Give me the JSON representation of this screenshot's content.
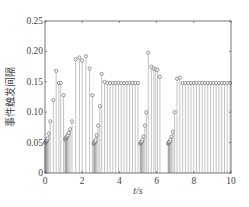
{
  "chart_data": {
    "type": "stem",
    "title": "",
    "xlabel": "t/s",
    "ylabel": "事件触发间隔",
    "xlim": [
      0,
      10
    ],
    "ylim": [
      0,
      0.25
    ],
    "xticks": [
      0,
      2,
      4,
      6,
      8,
      10
    ],
    "xtick_labels": [
      "0",
      "2",
      "4",
      "6",
      "8",
      "10"
    ],
    "yticks": [
      0,
      0.05,
      0.1,
      0.15,
      0.2,
      0.25
    ],
    "ytick_labels": [
      "0",
      "0.05",
      "0.10",
      "0.15",
      "0.20",
      "0.25"
    ],
    "grid": false,
    "legend": null,
    "marker": "circle",
    "series": [
      {
        "name": "event-trigger interval",
        "x": [
          0.0,
          0.02,
          0.04,
          0.06,
          0.08,
          0.1,
          0.12,
          0.15,
          0.2,
          0.28,
          0.45,
          0.6,
          0.75,
          0.85,
          1.0,
          1.08,
          1.1,
          1.12,
          1.14,
          1.16,
          1.18,
          1.22,
          1.28,
          1.35,
          1.45,
          1.65,
          1.85,
          2.0,
          2.2,
          2.4,
          2.55,
          2.62,
          2.64,
          2.66,
          2.68,
          2.7,
          2.73,
          2.78,
          2.85,
          2.95,
          3.05,
          3.2,
          3.35,
          3.5,
          3.65,
          3.8,
          3.95,
          4.1,
          4.25,
          4.4,
          4.55,
          4.7,
          4.85,
          5.0,
          5.12,
          5.14,
          5.16,
          5.18,
          5.2,
          5.24,
          5.3,
          5.37,
          5.45,
          5.55,
          5.72,
          5.85,
          5.95,
          6.05,
          6.18,
          6.62,
          6.64,
          6.66,
          6.68,
          6.7,
          6.74,
          6.8,
          6.88,
          6.97,
          7.1,
          7.25,
          7.4,
          7.55,
          7.7,
          7.85,
          8.0,
          8.15,
          8.3,
          8.45,
          8.6,
          8.75,
          8.9,
          9.05,
          9.2,
          9.35,
          9.5,
          9.65,
          9.8,
          9.95
        ],
        "y": [
          0.05,
          0.05,
          0.051,
          0.052,
          0.053,
          0.054,
          0.055,
          0.057,
          0.065,
          0.085,
          0.12,
          0.168,
          0.148,
          0.148,
          0.128,
          0.055,
          0.056,
          0.057,
          0.058,
          0.059,
          0.06,
          0.062,
          0.066,
          0.072,
          0.085,
          0.187,
          0.19,
          0.185,
          0.192,
          0.172,
          0.128,
          0.048,
          0.049,
          0.05,
          0.051,
          0.052,
          0.055,
          0.062,
          0.078,
          0.11,
          0.163,
          0.15,
          0.148,
          0.148,
          0.148,
          0.148,
          0.148,
          0.148,
          0.148,
          0.148,
          0.148,
          0.148,
          0.148,
          0.148,
          0.048,
          0.049,
          0.05,
          0.051,
          0.052,
          0.055,
          0.06,
          0.078,
          0.1,
          0.198,
          0.175,
          0.172,
          0.17,
          0.17,
          0.158,
          0.048,
          0.049,
          0.05,
          0.051,
          0.052,
          0.055,
          0.06,
          0.068,
          0.1,
          0.155,
          0.157,
          0.148,
          0.148,
          0.148,
          0.148,
          0.148,
          0.148,
          0.148,
          0.148,
          0.148,
          0.148,
          0.148,
          0.148,
          0.148,
          0.148,
          0.148,
          0.148,
          0.148,
          0.148
        ]
      }
    ]
  },
  "colors": {
    "axis": "#555555",
    "stem": "#9a9a9a",
    "marker": "#555555",
    "background": "#ffffff"
  }
}
